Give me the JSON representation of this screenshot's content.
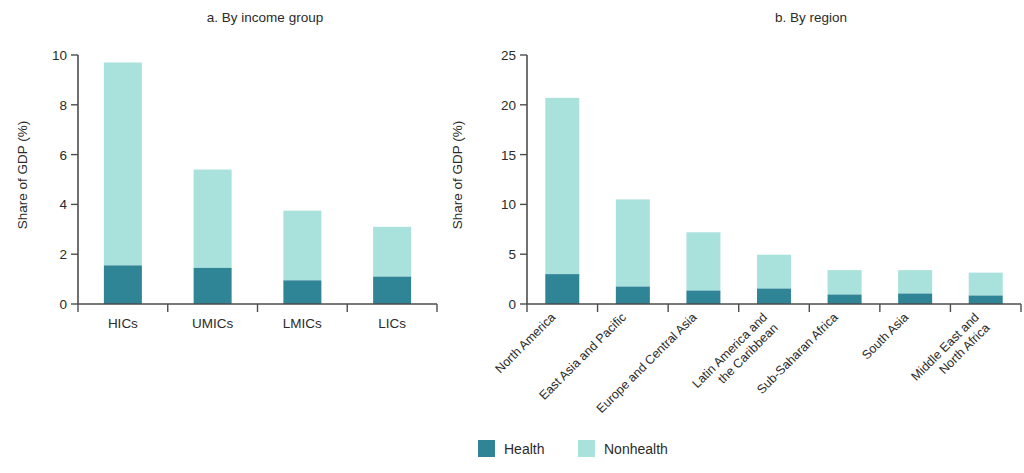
{
  "figure": {
    "background": "#ffffff",
    "legend": {
      "position": "bottom-center",
      "entries": [
        {
          "label": "Health",
          "color": "#2f8496"
        },
        {
          "label": "Nonhealth",
          "color": "#a9e1dd"
        }
      ]
    }
  },
  "chart_data": [
    {
      "type": "bar",
      "stacked": true,
      "title": "a. By income group",
      "xlabel": "",
      "ylabel": "Share of GDP (%)",
      "ylim": [
        0,
        10
      ],
      "yticks": [
        0,
        2,
        4,
        6,
        8,
        10
      ],
      "ytick_labels": [
        "0",
        "2",
        "4",
        "6",
        "8",
        "10"
      ],
      "grid": false,
      "categories": [
        "HICs",
        "UMICs",
        "LMICs",
        "LICs"
      ],
      "series": [
        {
          "name": "Health",
          "color": "#2f8496",
          "values": [
            1.55,
            1.45,
            0.95,
            1.1
          ]
        },
        {
          "name": "Nonhealth",
          "color": "#a9e1dd",
          "values": [
            8.15,
            3.95,
            2.8,
            2.0
          ]
        }
      ],
      "totals": [
        9.7,
        5.4,
        3.75,
        3.1
      ]
    },
    {
      "type": "bar",
      "stacked": true,
      "title": "b. By region",
      "xlabel": "",
      "ylabel": "Share of GDP (%)",
      "ylim": [
        0,
        25
      ],
      "yticks": [
        0,
        5,
        10,
        15,
        20,
        25
      ],
      "ytick_labels": [
        "0",
        "5",
        "10",
        "15",
        "20",
        "25"
      ],
      "grid": false,
      "categories": [
        "North America",
        "East Asia and Pacific",
        "Europe and Central Asia",
        "Latin America and\nthe Caribbean",
        "Sub-Saharan Africa",
        "South Asia",
        "Middle East and\nNorth Africa"
      ],
      "series": [
        {
          "name": "Health",
          "color": "#2f8496",
          "values": [
            3.0,
            1.75,
            1.35,
            1.55,
            0.95,
            1.05,
            0.85
          ]
        },
        {
          "name": "Nonhealth",
          "color": "#a9e1dd",
          "values": [
            17.7,
            8.75,
            5.85,
            3.4,
            2.45,
            2.35,
            2.3
          ]
        }
      ],
      "totals": [
        20.7,
        10.5,
        7.2,
        4.95,
        3.4,
        3.4,
        3.15
      ]
    }
  ]
}
